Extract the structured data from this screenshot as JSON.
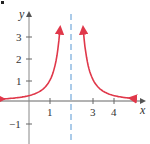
{
  "chart_data": {
    "type": "line",
    "title": "",
    "function": "y = 1/(x-2)^2",
    "xlabel": "x",
    "ylabel": "y",
    "xlim": [
      -1.3,
      4.9
    ],
    "ylim": [
      -1.9,
      3.9
    ],
    "x_ticks": [
      1,
      3,
      4
    ],
    "y_ticks": [
      3,
      2,
      1,
      -1
    ],
    "asymptote": {
      "type": "vertical",
      "x": 2,
      "style": "dashed",
      "color": "#7fb0dd"
    },
    "series": [
      {
        "name": "left branch",
        "color": "#e0384a",
        "x": [
          -1.3,
          -1,
          -0.5,
          0,
          0.5,
          1,
          1.25,
          1.5
        ],
        "y": [
          0.09,
          0.11,
          0.16,
          0.25,
          0.44,
          1,
          1.78,
          4
        ]
      },
      {
        "name": "right branch",
        "color": "#e0384a",
        "x": [
          2.5,
          2.75,
          3,
          3.5,
          4,
          4.5,
          4.9
        ],
        "y": [
          4,
          1.78,
          1,
          0.44,
          0.25,
          0.16,
          0.12
        ]
      }
    ],
    "grid": false,
    "legend": null
  },
  "labels": {
    "x_axis": "x",
    "y_axis": "y",
    "xticks": [
      "1",
      "3",
      "4"
    ],
    "yticks": [
      "3",
      "2",
      "1",
      "−1"
    ]
  },
  "colors": {
    "curve": "#e0384a",
    "asymptote": "#7fb0dd",
    "axis": "#555555"
  }
}
